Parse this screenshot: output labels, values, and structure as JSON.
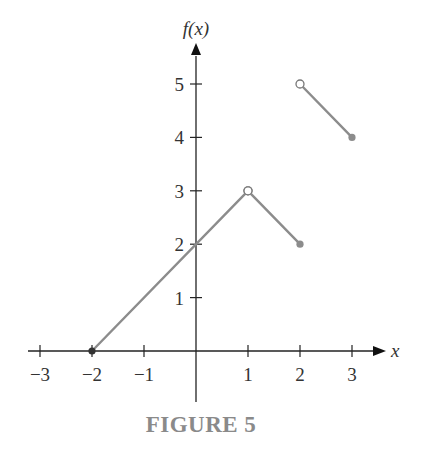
{
  "chart_data": {
    "type": "line",
    "title": "",
    "caption": "FIGURE 5",
    "xlabel": "x",
    "ylabel": "f(x)",
    "xlim": [
      -3.5,
      3.6
    ],
    "ylim": [
      -1,
      5.8
    ],
    "x_ticks": [
      -3,
      -2,
      -1,
      1,
      2,
      3
    ],
    "x_tick_labels": [
      "−3",
      "−2",
      "−1",
      "1",
      "2",
      "3"
    ],
    "y_ticks": [
      1,
      2,
      3,
      4,
      5
    ],
    "y_tick_labels": [
      "1",
      "2",
      "3",
      "4",
      "5"
    ],
    "grid": false,
    "series": [
      {
        "name": "piece-1",
        "points": [
          [
            -2,
            0
          ],
          [
            1,
            3
          ]
        ],
        "start_marker": "filled",
        "end_marker": "open"
      },
      {
        "name": "piece-2",
        "points": [
          [
            1,
            3
          ],
          [
            2,
            2
          ]
        ],
        "start_marker": "open",
        "end_marker": "filled"
      },
      {
        "name": "piece-3",
        "points": [
          [
            2,
            5
          ],
          [
            3,
            4
          ]
        ],
        "start_marker": "open",
        "end_marker": "filled"
      }
    ],
    "colors": {
      "curve": "#8c8c8c",
      "axis": "#222222",
      "caption": "#8a8a8a"
    }
  }
}
